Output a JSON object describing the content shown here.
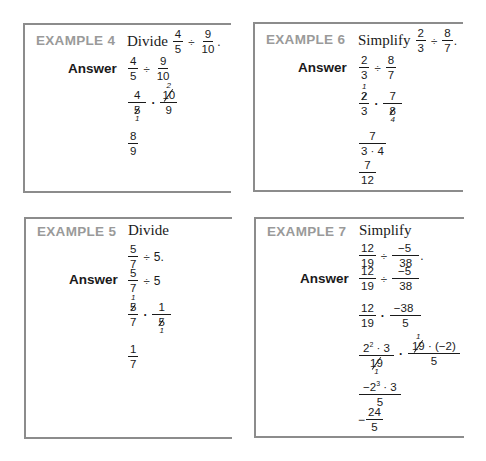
{
  "examples": [
    {
      "id": "example-4",
      "label": "EXAMPLE 4",
      "verb": "Divide",
      "problem": {
        "a_num": "4",
        "a_den": "5",
        "op": "÷",
        "b_num": "9",
        "b_den": "10",
        "end": "."
      },
      "answer_label": "Answer",
      "steps": [
        {
          "type": "div",
          "a_num": "4",
          "a_den": "5",
          "op": "÷",
          "b_num": "9",
          "b_den": "10"
        },
        {
          "type": "mul-cancel",
          "a_num": "4",
          "a_den": "5",
          "a_den_cancel": "1",
          "op": "·",
          "b_num": "10",
          "b_num_cancel": "2",
          "b_den": "9"
        },
        {
          "type": "result",
          "num": "8",
          "den": "9"
        }
      ]
    },
    {
      "id": "example-6",
      "label": "EXAMPLE 6",
      "verb": "Simplify",
      "problem": {
        "a_num": "2",
        "a_den": "3",
        "op": "÷",
        "b_num": "8",
        "b_den": "7",
        "end": "."
      },
      "answer_label": "Answer",
      "steps": [
        {
          "type": "div",
          "a_num": "2",
          "a_den": "3",
          "op": "÷",
          "b_num": "8",
          "b_den": "7"
        },
        {
          "type": "mul-cancel",
          "a_num": "2",
          "a_num_cancel": "1",
          "a_den": "3",
          "op": "·",
          "b_num": "7",
          "b_den": "8",
          "b_den_cancel": "4"
        },
        {
          "type": "frac",
          "num": "7",
          "den": "3 · 4"
        },
        {
          "type": "result",
          "num": "7",
          "den": "12"
        }
      ]
    },
    {
      "id": "example-5",
      "label": "EXAMPLE 5",
      "verb": "Divide",
      "problem": {
        "a_num": "5",
        "a_den": "7",
        "op": "÷",
        "b": "5",
        "end": "."
      },
      "answer_label": "Answer",
      "steps": [
        {
          "type": "div-whole",
          "a_num": "5",
          "a_den": "7",
          "op": "÷",
          "b": "5"
        },
        {
          "type": "mul-cancel",
          "a_num": "5",
          "a_num_cancel": "1",
          "a_den": "7",
          "op": "·",
          "b_num": "1",
          "b_den": "5",
          "b_den_cancel": "1"
        },
        {
          "type": "result",
          "num": "1",
          "den": "7"
        }
      ]
    },
    {
      "id": "example-7",
      "label": "EXAMPLE 7",
      "verb": "Simplify",
      "problem": {
        "a_num": "12",
        "a_den": "19",
        "op": "÷",
        "b_num": "−5",
        "b_den": "38",
        "end": "."
      },
      "answer_label": "Answer",
      "steps": [
        {
          "type": "div",
          "a_num": "12",
          "a_den": "19",
          "op": "÷",
          "b_num": "−5",
          "b_den": "38"
        },
        {
          "type": "mul",
          "a_num": "12",
          "a_den": "19",
          "op": "·",
          "b_num": "−38",
          "b_den": "5"
        },
        {
          "type": "mul-factored",
          "a_num_base": "2",
          "a_num_exp": "2",
          "a_num_rest": " · 3",
          "a_den": "19",
          "a_den_cancel": "1",
          "op": "·",
          "b_num_struck": "19",
          "b_num_cancel": "1",
          "b_num_rest": " · (−2)",
          "b_den": "5"
        },
        {
          "type": "frac-exp",
          "num_prefix": "−2",
          "num_exp": "3",
          "num_rest": " · 3",
          "den": "5"
        },
        {
          "type": "result-neg",
          "sign": "−",
          "num": "24",
          "den": "5"
        }
      ]
    }
  ]
}
